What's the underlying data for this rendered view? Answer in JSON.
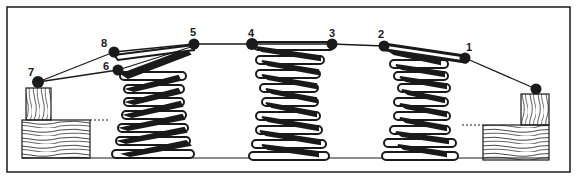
{
  "figure": {
    "colors": {
      "ink": "#1a1a1a",
      "paper": "#ffffff"
    },
    "knot_labels": [
      {
        "id": "1",
        "text": "1"
      },
      {
        "id": "2",
        "text": "2"
      },
      {
        "id": "3",
        "text": "3"
      },
      {
        "id": "4",
        "text": "4"
      },
      {
        "id": "5",
        "text": "5"
      },
      {
        "id": "6",
        "text": "6"
      },
      {
        "id": "7",
        "text": "7"
      },
      {
        "id": "8",
        "text": "8"
      }
    ],
    "components": {
      "springs": [
        "left-spring",
        "center-spring",
        "right-spring"
      ],
      "frame_rails": [
        "left-rail",
        "right-rail"
      ],
      "twine": "tying-cord"
    }
  }
}
